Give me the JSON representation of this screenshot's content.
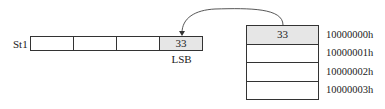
{
  "register": {
    "name": "St1",
    "cells": [
      "",
      "",
      "",
      "33"
    ],
    "lsb_label": "LSB"
  },
  "memory": {
    "cells": [
      {
        "value": "33",
        "address": "10000000h"
      },
      {
        "value": "",
        "address": "10000001h"
      },
      {
        "value": "",
        "address": "10000002h"
      },
      {
        "value": "",
        "address": "10000003h"
      }
    ]
  },
  "colors": {
    "filled_cell": "#e6e6e6",
    "line": "#333333"
  }
}
